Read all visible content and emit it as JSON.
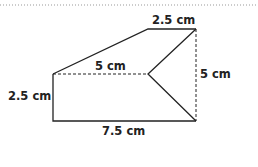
{
  "figure": {
    "labels": {
      "top": "2.5 cm",
      "middle": "5 cm",
      "right": "5 cm",
      "left": "2.5 cm",
      "bottom": "7.5 cm"
    },
    "colors": {
      "line": "#222222",
      "dotted_rule": "#888888"
    }
  }
}
